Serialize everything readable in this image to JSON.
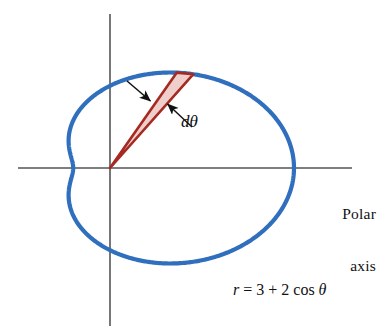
{
  "figure": {
    "type": "polar-curve-diagram",
    "background_color": "#ffffff"
  },
  "colors": {
    "curve_blue": "#2f6fbd",
    "wedge_fill": "#efcfcb",
    "wedge_stroke": "#a52a22",
    "axis_gray": "#555555",
    "text_black": "#111111"
  },
  "axes": {
    "origin": {
      "x": 110,
      "y": 168
    },
    "horizontal": {
      "x1": 18,
      "x2": 352,
      "y": 168
    },
    "vertical": {
      "x": 110,
      "y1": 14,
      "y2": 326
    },
    "polar_axis_label": {
      "line1": "Polar",
      "line2": "axis"
    }
  },
  "curve": {
    "name": "limacon",
    "equation_text": {
      "r": "r",
      "equals": " = 3 + 2 cos ",
      "theta": "θ"
    },
    "equation_plain": "r = 3 + 2 cos θ",
    "scale_px_per_unit_x": 36.8,
    "scale_px_per_unit_y": 27.4,
    "r_max": 5,
    "r_min": 1,
    "stroke_width": 4
  },
  "wedge": {
    "label": "dθ",
    "apex": {
      "x": 110,
      "y": 168
    },
    "theta_start_deg": 56.5,
    "theta_end_deg": 62.5,
    "tip_left": {
      "x": 203,
      "y": 25
    },
    "tip_right": {
      "x": 223,
      "y": 44
    },
    "fill": "#efcfcb",
    "stroke": "#a52a22"
  },
  "annotations": [
    {
      "name": "upper-leader-arrow",
      "from": {
        "x": 127,
        "y": 81
      },
      "to": {
        "x": 152,
        "y": 102
      }
    },
    {
      "name": "lower-leader-arrow",
      "from": {
        "x": 192,
        "y": 127
      },
      "to": {
        "x": 166,
        "y": 103
      }
    }
  ],
  "chart_data": {
    "type": "line",
    "title": "",
    "xlabel": "Polar axis",
    "ylabel": "",
    "polar": true,
    "equation": "r = 3 + 2 cos θ",
    "theta_range_deg": [
      0,
      360
    ],
    "r_values_by_theta_deg": {
      "0": 5.0,
      "30": 4.73,
      "60": 4.0,
      "90": 3.0,
      "120": 2.0,
      "150": 1.27,
      "180": 1.0,
      "210": 1.27,
      "240": 2.0,
      "270": 3.0,
      "300": 4.0,
      "330": 4.73,
      "360": 5.0
    },
    "annotations": [
      "dθ",
      "Polar axis",
      "r = 3 + 2 cos θ"
    ],
    "grid": false,
    "legend": "none"
  }
}
